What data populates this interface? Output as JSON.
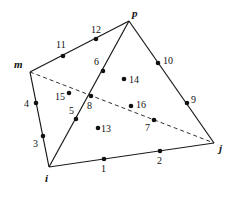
{
  "diagram": {
    "title": "",
    "type": "tetrahedral element with 16 nodes",
    "vertices": [
      {
        "id": "m",
        "label": "m",
        "x": 30,
        "y": 72,
        "lx": 14,
        "ly": 68
      },
      {
        "id": "p",
        "label": "p",
        "x": 129,
        "y": 21,
        "lx": 132,
        "ly": 17
      },
      {
        "id": "i",
        "label": "i",
        "x": 49,
        "y": 167,
        "lx": 45,
        "ly": 182
      },
      {
        "id": "j",
        "label": "j",
        "x": 214,
        "y": 143,
        "lx": 219,
        "ly": 152
      }
    ],
    "edges": [
      {
        "from": "m",
        "to": "p",
        "style": "solid"
      },
      {
        "from": "m",
        "to": "i",
        "style": "solid"
      },
      {
        "from": "i",
        "to": "p",
        "style": "solid"
      },
      {
        "from": "i",
        "to": "j",
        "style": "solid"
      },
      {
        "from": "p",
        "to": "j",
        "style": "solid"
      },
      {
        "from": "m",
        "to": "j",
        "style": "dashed"
      }
    ],
    "nodes": [
      {
        "label": "1",
        "x": 104,
        "y": 159,
        "lx": 101,
        "ly": 172
      },
      {
        "label": "2",
        "x": 160,
        "y": 151,
        "lx": 157,
        "ly": 164
      },
      {
        "label": "3",
        "x": 43,
        "y": 136,
        "lx": 33,
        "ly": 147
      },
      {
        "label": "4",
        "x": 36,
        "y": 103,
        "lx": 24,
        "ly": 107
      },
      {
        "label": "5",
        "x": 76,
        "y": 119,
        "lx": 69,
        "ly": 114
      },
      {
        "label": "6",
        "x": 103,
        "y": 71,
        "lx": 94,
        "ly": 65
      },
      {
        "label": "7",
        "x": 154,
        "y": 120,
        "lx": 145,
        "ly": 131
      },
      {
        "label": "8",
        "x": 91,
        "y": 96,
        "lx": 87,
        "ly": 109
      },
      {
        "label": "9",
        "x": 187,
        "y": 103,
        "lx": 191,
        "ly": 103
      },
      {
        "label": "10",
        "x": 158,
        "y": 63,
        "lx": 163,
        "ly": 64
      },
      {
        "label": "11",
        "x": 63,
        "y": 56,
        "lx": 56,
        "ly": 48
      },
      {
        "label": "12",
        "x": 96,
        "y": 39,
        "lx": 91,
        "ly": 33
      },
      {
        "label": "13",
        "x": 98,
        "y": 128,
        "lx": 101,
        "ly": 132
      },
      {
        "label": "14",
        "x": 124,
        "y": 79,
        "lx": 129,
        "ly": 83
      },
      {
        "label": "15",
        "x": 69,
        "y": 93,
        "lx": 55,
        "ly": 100
      },
      {
        "label": "16",
        "x": 131,
        "y": 106,
        "lx": 136,
        "ly": 108
      }
    ]
  }
}
